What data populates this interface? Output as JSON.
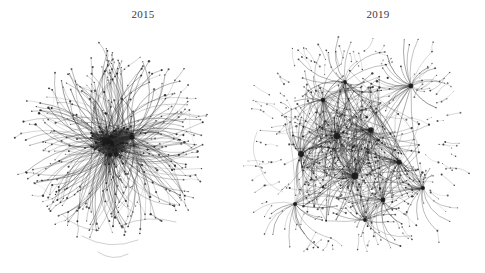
{
  "figure": {
    "background_color": "#ffffff",
    "width": 485,
    "height": 273,
    "type": "network-graph-comparison",
    "edge_color": "#2e2e2e",
    "node_color": "#1a1a1a",
    "title_color": "#3b3b3b"
  },
  "panels": [
    {
      "id": "2015",
      "label": "2015",
      "description": "dense single-core radial hairball network",
      "center": {
        "x": 112,
        "y": 143
      },
      "radius": 88,
      "node_count": 430,
      "edge_count": 980,
      "hub_count": 3,
      "density": "high",
      "structure": "monolithic-core",
      "seed": 20150
    },
    {
      "id": "2019",
      "label": "2019",
      "description": "dispersed multi-hub network with star clusters",
      "center": {
        "x": 353,
        "y": 148
      },
      "radius": 98,
      "node_count": 520,
      "edge_count": 830,
      "hub_count": 12,
      "density": "medium",
      "structure": "multi-hub-modular",
      "seed": 20190
    }
  ],
  "chart_data": {
    "type": "scatter",
    "title": "",
    "xlabel": "",
    "ylabel": "",
    "categories": [
      "2015",
      "2019"
    ],
    "series": [
      {
        "name": "nodes",
        "values": [
          430,
          520
        ]
      },
      {
        "name": "edges",
        "values": [
          980,
          830
        ]
      },
      {
        "name": "hubs",
        "values": [
          3,
          12
        ]
      }
    ],
    "legend": [],
    "grid": false
  }
}
